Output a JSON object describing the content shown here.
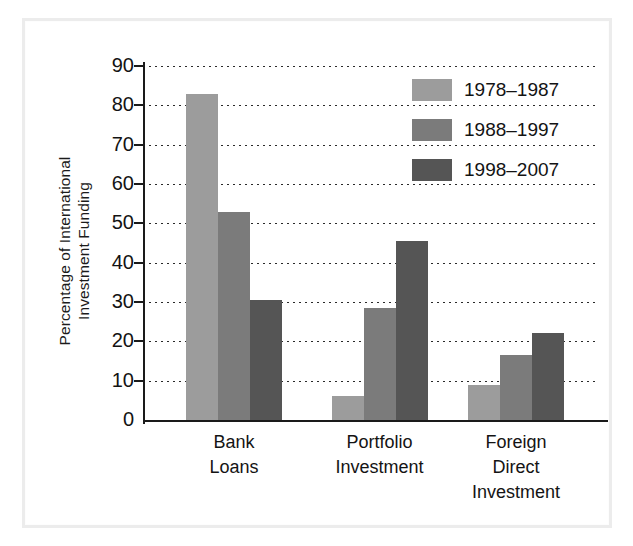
{
  "figure": {
    "background_color": "#ffffff",
    "frame_color": "#ececec"
  },
  "chart_data": {
    "type": "bar",
    "title": "",
    "subtitle": "",
    "xlabel": "",
    "ylabel": "Percentage of International\nInvestment Funding",
    "categories": [
      "Bank\nLoans",
      "Portfolio\nInvestment",
      "Foreign\nDirect\nInvestment"
    ],
    "series": [
      {
        "name": "1978–1987",
        "color": "#9c9c9c",
        "values": [
          83,
          6,
          9
        ]
      },
      {
        "name": "1988–1997",
        "color": "#7b7b7b",
        "values": [
          53,
          28.5,
          16.5
        ]
      },
      {
        "name": "1998–2007",
        "color": "#555555",
        "values": [
          30.5,
          45.5,
          22
        ]
      }
    ],
    "ylim": [
      0,
      90
    ],
    "yticks": [
      0,
      10,
      20,
      30,
      40,
      50,
      60,
      70,
      80,
      90
    ],
    "ytick_labels": [
      "0",
      "10",
      "20",
      "30",
      "40",
      "50",
      "60",
      "70",
      "80",
      "90"
    ],
    "grid": true,
    "grid_style": "dotted",
    "grid_axis": "y",
    "legend_position": "upper right",
    "bar_group_centers_pct": [
      20,
      52,
      82
    ],
    "bar_width_px": 32
  },
  "legend": {
    "entries": [
      {
        "label": "1978–1987",
        "color": "#9c9c9c"
      },
      {
        "label": "1988–1997",
        "color": "#7b7b7b"
      },
      {
        "label": "1998–2007",
        "color": "#555555"
      }
    ]
  },
  "axis": {
    "y_title_line1": "Percentage of International",
    "y_title_line2": "Investment Funding"
  }
}
